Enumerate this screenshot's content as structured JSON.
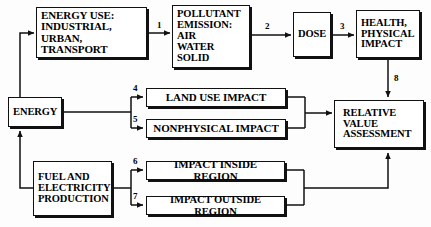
{
  "diagram": {
    "background_color": "#fdfdfd",
    "line_color": "#111111",
    "text_color": "#000000",
    "nodes": [
      {
        "id": "energy_use",
        "label": "ENERGY USE:\nINDUSTRIAL,\nURBAN, TRANSPORT"
      },
      {
        "id": "pollutant",
        "label": "POLLUTANT\nEMISSION:\nAIR\nWATER\nSOLID"
      },
      {
        "id": "dose",
        "label": "DOSE"
      },
      {
        "id": "health",
        "label": "HEALTH,\nPHYSICAL\nIMPACT"
      },
      {
        "id": "energy",
        "label": "ENERGY"
      },
      {
        "id": "fuel",
        "label": "FUEL AND\nELECTRICITY\nPRODUCTION"
      },
      {
        "id": "land_use",
        "label": "LAND USE IMPACT"
      },
      {
        "id": "nonphysical",
        "label": "NONPHYSICAL IMPACT"
      },
      {
        "id": "impact_inside",
        "label": "IMPACT INSIDE REGION"
      },
      {
        "id": "impact_outside",
        "label": "IMPACT OUTSIDE REGION"
      },
      {
        "id": "relative_value",
        "label": "RELATIVE\nVALUE\nASSESSMENT"
      }
    ],
    "edge_numbers": [
      {
        "id": "n1",
        "label": "1",
        "from": "energy_use",
        "to": "pollutant"
      },
      {
        "id": "n2",
        "label": "2",
        "from": "pollutant",
        "to": "dose"
      },
      {
        "id": "n3",
        "label": "3",
        "from": "dose",
        "to": "health"
      },
      {
        "id": "n4",
        "label": "4",
        "from": "energy",
        "to": "land_use"
      },
      {
        "id": "n5",
        "label": "5",
        "from": "energy",
        "to": "nonphysical"
      },
      {
        "id": "n6",
        "label": "6",
        "from": "fuel",
        "to": "impact_inside"
      },
      {
        "id": "n7",
        "label": "7",
        "from": "fuel",
        "to": "impact_outside"
      },
      {
        "id": "n8",
        "label": "8",
        "from": "health",
        "to": "relative_value"
      }
    ]
  }
}
